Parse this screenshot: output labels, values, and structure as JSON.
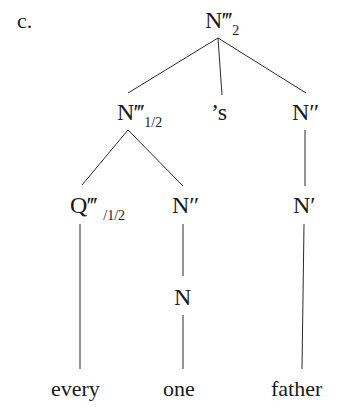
{
  "example_label": "c.",
  "tree": {
    "root": {
      "cat": "N‴",
      "sub": "2"
    },
    "level1": {
      "left": {
        "cat": "N‴",
        "sub": "1/2"
      },
      "mid": {
        "cat": "’s"
      },
      "right": {
        "cat": "N″"
      }
    },
    "level2": {
      "q": {
        "cat": "Q‴",
        "sub": "/1/2"
      },
      "n2": {
        "cat": "N″"
      },
      "right": {
        "cat": "N′"
      }
    },
    "level3": {
      "n": {
        "cat": "N"
      }
    },
    "words": [
      "every",
      "one",
      "father"
    ]
  }
}
